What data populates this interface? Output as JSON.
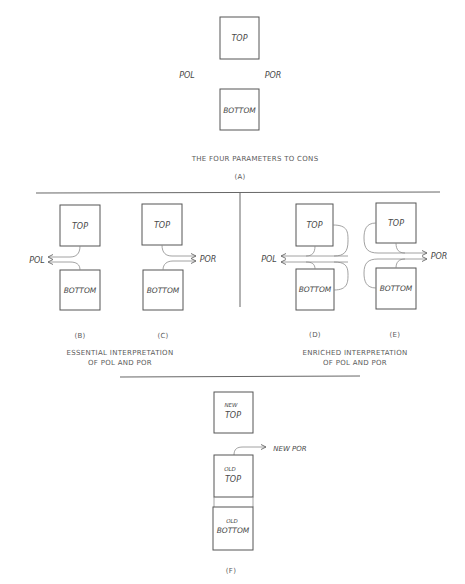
{
  "panel_a": {
    "box_top": "TOP",
    "box_bottom": "BOTTOM",
    "pol": "POL",
    "por": "POR",
    "caption": "THE FOUR PARAMETERS TO CONS",
    "label": "(A)"
  },
  "panel_b": {
    "box_top": "TOP",
    "box_bottom": "BOTTOM",
    "arrow_label": "POL",
    "label": "(B)"
  },
  "panel_c": {
    "box_top": "TOP",
    "box_bottom": "BOTTOM",
    "arrow_label": "POR",
    "label": "(C)"
  },
  "essential_caption": {
    "line1": "ESSENTIAL INTERPRETATION",
    "line2": "OF POL AND POR"
  },
  "panel_d": {
    "box_top": "TOP",
    "box_bottom": "BOTTOM",
    "arrow_label": "POL",
    "label": "(D)"
  },
  "panel_e": {
    "box_top": "TOP",
    "box_bottom": "BOTTOM",
    "arrow_label": "POR",
    "label": "(E)"
  },
  "enriched_caption": {
    "line1": "ENRICHED INTERPRETATION",
    "line2": "OF POL AND POR"
  },
  "panel_f": {
    "new_top_line1": "NEW",
    "new_top_line2": "TOP",
    "old_top_line1": "OLD",
    "old_top_line2": "TOP",
    "old_bottom_line1": "OLD",
    "old_bottom_line2": "BOTTOM",
    "arrow_label": "NEW POR",
    "label": "(F)"
  },
  "colors": {
    "ink": "#555555",
    "background": "#ffffff"
  }
}
